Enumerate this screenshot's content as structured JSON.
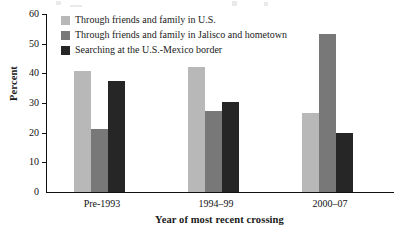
{
  "chart_data": {
    "type": "bar",
    "title": "",
    "xlabel": "Year of most recent crossing",
    "ylabel": "Percent",
    "categories": [
      "Pre-1993",
      "1994–99",
      "2000–07"
    ],
    "series": [
      {
        "name": "Through friends and family in U.S.",
        "color": "#b8b8b8",
        "values": [
          40.8,
          42.2,
          26.5
        ]
      },
      {
        "name": "Through friends and family in Jalisco and hometown",
        "color": "#787878",
        "values": [
          21.2,
          27.4,
          53.2
        ]
      },
      {
        "name": "Searching at the U.S.-Mexico border",
        "color": "#262626",
        "values": [
          37.4,
          30.2,
          20.0
        ]
      }
    ],
    "ylim": [
      0,
      60
    ],
    "ytick_step": 10,
    "yticks": [
      "60",
      "50",
      "40",
      "30",
      "20",
      "10",
      "0"
    ],
    "grid": false,
    "legend_position": "top-left-inside"
  },
  "axes": {
    "y_title": "Percent",
    "x_title": "Year of most recent crossing"
  },
  "legend": {
    "items": [
      {
        "label": "Through friends and family in U.S."
      },
      {
        "label": "Through friends and family in Jalisco and hometown"
      },
      {
        "label": "Searching at the U.S.-Mexico border"
      }
    ]
  },
  "colors": {
    "series_light": "#b8b8b8",
    "series_medium": "#787878",
    "series_dark": "#262626",
    "axis": "#111111",
    "background": "#ffffff"
  }
}
